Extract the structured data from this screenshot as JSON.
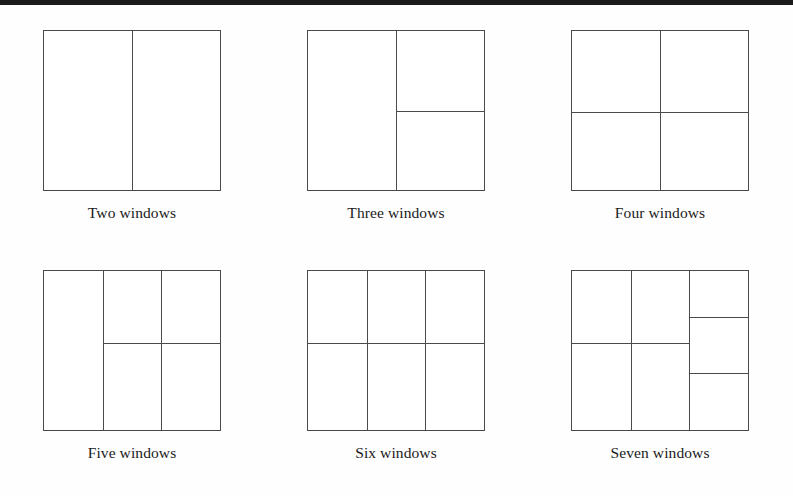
{
  "page": {
    "background_color": "#fefefe",
    "top_bar_color": "#1b1b1b",
    "line_color": "#4a4a4a",
    "text_color": "#1a1a1a"
  },
  "figures": [
    {
      "id": "two-windows",
      "caption": "Two windows",
      "pane_count": 2,
      "verticals": [
        50
      ],
      "horizontals": [],
      "segments": []
    },
    {
      "id": "three-windows",
      "caption": "Three windows",
      "pane_count": 3,
      "verticals": [
        50
      ],
      "horizontals": [],
      "segments": [
        {
          "type": "horizontal",
          "pos": 50,
          "from": 50,
          "to": 100
        }
      ]
    },
    {
      "id": "four-windows",
      "caption": "Four windows",
      "pane_count": 4,
      "verticals": [
        50
      ],
      "horizontals": [
        51
      ],
      "segments": []
    },
    {
      "id": "five-windows",
      "caption": "Five windows",
      "pane_count": 5,
      "verticals": [
        33.3,
        66.6
      ],
      "horizontals": [],
      "segments": [
        {
          "type": "horizontal",
          "pos": 45.5,
          "from": 33.3,
          "to": 100
        }
      ]
    },
    {
      "id": "six-windows",
      "caption": "Six windows",
      "pane_count": 6,
      "verticals": [
        33.3,
        66.6
      ],
      "horizontals": [
        45.5
      ],
      "segments": []
    },
    {
      "id": "seven-windows",
      "caption": "Seven windows",
      "pane_count": 7,
      "verticals": [
        33.3,
        66.6
      ],
      "horizontals": [],
      "segments": [
        {
          "type": "horizontal",
          "pos": 45.5,
          "from": 0,
          "to": 66.6
        },
        {
          "type": "horizontal",
          "pos": 29.0,
          "from": 66.6,
          "to": 100
        },
        {
          "type": "horizontal",
          "pos": 64.0,
          "from": 66.6,
          "to": 100
        }
      ]
    }
  ]
}
